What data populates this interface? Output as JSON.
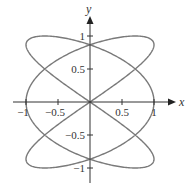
{
  "chart_data": {
    "type": "line",
    "title": "",
    "xlabel": "x",
    "ylabel": "y",
    "xlim": [
      -1.2,
      1.3
    ],
    "ylim": [
      -1.25,
      1.3
    ],
    "grid": false,
    "legend": null,
    "parametric": {
      "x_expr": "cos(3t)",
      "y_expr": "sin(2t)",
      "t_range": [
        0,
        6.2832
      ]
    },
    "x_ticks": [
      -1,
      -0.5,
      0.5,
      1
    ],
    "x_tick_labels": [
      "−1",
      "−0.5",
      "0.5",
      "1"
    ],
    "y_ticks": [
      1,
      0.5,
      -0.5,
      -1
    ],
    "y_tick_labels": [
      "1",
      "0.5",
      "−0.5",
      "−1"
    ],
    "key_points": [
      {
        "x": 1,
        "y": 0
      },
      {
        "x": -1,
        "y": 0.866
      },
      {
        "x": -1,
        "y": -0.866
      },
      {
        "x": 1,
        "y": 0.866
      },
      {
        "x": 1,
        "y": -0.866
      },
      {
        "x": -0.707,
        "y": 1
      },
      {
        "x": 0.707,
        "y": -1
      },
      {
        "x": 0,
        "y": 0.866
      },
      {
        "x": 0,
        "y": -0.866
      },
      {
        "x": 0,
        "y": 0
      }
    ],
    "colors": {
      "curve": "#7a7a7a",
      "axes": "#333333"
    }
  },
  "labels": {
    "x_axis": "x",
    "y_axis": "y"
  }
}
